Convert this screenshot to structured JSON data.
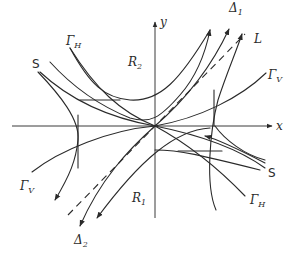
{
  "figure": {
    "type": "phase-portrait-saddle",
    "axes": {
      "x_label": "x",
      "y_label": "y"
    },
    "labels": {
      "delta1": {
        "main": "Δ",
        "sub": "1"
      },
      "delta2": {
        "main": "Δ",
        "sub": "2"
      },
      "line_L": "L",
      "gamma_v_top": {
        "main": "Γ",
        "sub": "V"
      },
      "gamma_v_bottom": {
        "main": "Γ",
        "sub": "V"
      },
      "gamma_h_top": {
        "main": "Γ",
        "sub": "H"
      },
      "gamma_h_bottom": {
        "main": "Γ",
        "sub": "H"
      },
      "region_r2": {
        "main": "R",
        "sub": "2"
      },
      "region_r1": {
        "main": "R",
        "sub": "1"
      },
      "separatrix_top": "S",
      "separatrix_bottom": "S"
    },
    "colors": {
      "ink": "#2a2a2a",
      "background": "#ffffff"
    }
  }
}
